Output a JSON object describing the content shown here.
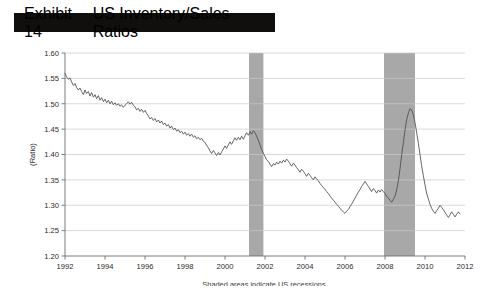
{
  "exhibit": {
    "number": "Exhibit 14",
    "title": "US Inventory/Sales Ratios"
  },
  "footnote": "Shaded areas indicate US recessions.",
  "colors": {
    "title_bar_bg": "#100f0d",
    "title_text": "#ffffff",
    "series_line": "#4c4c4c",
    "recession_band": "#a8a8a8",
    "grid": "#c9c9c9",
    "axis": "#6e6e6e",
    "page_bg": "#ffffff"
  },
  "chart_data": {
    "type": "line",
    "title": "US Inventory/Sales Ratios",
    "xlabel": "",
    "ylabel": "(Ratio)",
    "xlim": [
      1992,
      2012
    ],
    "ylim": [
      1.2,
      1.6
    ],
    "grid": true,
    "legend": "none",
    "xticks": [
      1992,
      1994,
      1996,
      1998,
      2000,
      2002,
      2004,
      2006,
      2008,
      2010,
      2012
    ],
    "xticklabels": [
      "1992",
      "1994",
      "1996",
      "1998",
      "2000",
      "2002",
      "2004",
      "2006",
      "2008",
      "2010",
      "2012"
    ],
    "yticks": [
      1.2,
      1.25,
      1.3,
      1.35,
      1.4,
      1.45,
      1.5,
      1.55,
      1.6
    ],
    "yticklabels": [
      "1.20",
      "1.25",
      "1.30",
      "1.35",
      "1.40",
      "1.45",
      "1.50",
      "1.55",
      "1.60"
    ],
    "annotations": [
      {
        "text": "Shaded areas indicate US recessions.",
        "position": "below-axis-center"
      }
    ],
    "shaded_regions": [
      {
        "label": "2001 recession",
        "x_start": 2001.2,
        "x_end": 2001.92,
        "color": "#a8a8a8"
      },
      {
        "label": "2007-2009 recession",
        "x_start": 2007.95,
        "x_end": 2009.5,
        "color": "#a8a8a8"
      }
    ],
    "series": [
      {
        "name": "US Inventory/Sales Ratio",
        "x": [
          1992.0,
          1992.08,
          1992.17,
          1992.25,
          1992.33,
          1992.42,
          1992.5,
          1992.58,
          1992.67,
          1992.75,
          1992.83,
          1992.92,
          1993.0,
          1993.08,
          1993.17,
          1993.25,
          1993.33,
          1993.42,
          1993.5,
          1993.58,
          1993.67,
          1993.75,
          1993.83,
          1993.92,
          1994.0,
          1994.08,
          1994.17,
          1994.25,
          1994.33,
          1994.42,
          1994.5,
          1994.58,
          1994.67,
          1994.75,
          1994.83,
          1994.92,
          1995.0,
          1995.08,
          1995.17,
          1995.25,
          1995.33,
          1995.42,
          1995.5,
          1995.58,
          1995.67,
          1995.75,
          1995.83,
          1995.92,
          1996.0,
          1996.08,
          1996.17,
          1996.25,
          1996.33,
          1996.42,
          1996.5,
          1996.58,
          1996.67,
          1996.75,
          1996.83,
          1996.92,
          1997.0,
          1997.08,
          1997.17,
          1997.25,
          1997.33,
          1997.42,
          1997.5,
          1997.58,
          1997.67,
          1997.75,
          1997.83,
          1997.92,
          1998.0,
          1998.08,
          1998.17,
          1998.25,
          1998.33,
          1998.42,
          1998.5,
          1998.58,
          1998.67,
          1998.75,
          1998.83,
          1998.92,
          1999.0,
          1999.08,
          1999.17,
          1999.25,
          1999.33,
          1999.42,
          1999.5,
          1999.58,
          1999.67,
          1999.75,
          1999.83,
          1999.92,
          2000.0,
          2000.08,
          2000.17,
          2000.25,
          2000.33,
          2000.42,
          2000.5,
          2000.58,
          2000.67,
          2000.75,
          2000.83,
          2000.92,
          2001.0,
          2001.08,
          2001.17,
          2001.25,
          2001.33,
          2001.42,
          2001.5,
          2001.58,
          2001.67,
          2001.75,
          2001.83,
          2001.92,
          2002.0,
          2002.08,
          2002.17,
          2002.25,
          2002.33,
          2002.42,
          2002.5,
          2002.58,
          2002.67,
          2002.75,
          2002.83,
          2002.92,
          2003.0,
          2003.08,
          2003.17,
          2003.25,
          2003.33,
          2003.42,
          2003.5,
          2003.58,
          2003.67,
          2003.75,
          2003.83,
          2003.92,
          2004.0,
          2004.08,
          2004.17,
          2004.25,
          2004.33,
          2004.42,
          2004.5,
          2004.58,
          2004.67,
          2004.75,
          2004.83,
          2004.92,
          2005.0,
          2005.08,
          2005.17,
          2005.25,
          2005.33,
          2005.42,
          2005.5,
          2005.58,
          2005.67,
          2005.75,
          2005.83,
          2005.92,
          2006.0,
          2006.08,
          2006.17,
          2006.25,
          2006.33,
          2006.42,
          2006.5,
          2006.58,
          2006.67,
          2006.75,
          2006.83,
          2006.92,
          2007.0,
          2007.08,
          2007.17,
          2007.25,
          2007.33,
          2007.42,
          2007.5,
          2007.58,
          2007.67,
          2007.75,
          2007.83,
          2007.92,
          2008.0,
          2008.08,
          2008.17,
          2008.25,
          2008.33,
          2008.42,
          2008.5,
          2008.58,
          2008.67,
          2008.75,
          2008.83,
          2008.92,
          2009.0,
          2009.08,
          2009.17,
          2009.25,
          2009.33,
          2009.42,
          2009.5,
          2009.58,
          2009.67,
          2009.75,
          2009.83,
          2009.92,
          2010.0,
          2010.08,
          2010.17,
          2010.25,
          2010.33,
          2010.42,
          2010.5,
          2010.58,
          2010.67,
          2010.75,
          2010.83,
          2010.92,
          2011.0,
          2011.08,
          2011.17,
          2011.25,
          2011.33,
          2011.42,
          2011.5,
          2011.58,
          2011.67,
          2011.75
        ],
        "y": [
          1.56,
          1.553,
          1.548,
          1.551,
          1.543,
          1.536,
          1.54,
          1.532,
          1.527,
          1.531,
          1.524,
          1.518,
          1.527,
          1.52,
          1.524,
          1.515,
          1.522,
          1.513,
          1.518,
          1.51,
          1.516,
          1.507,
          1.512,
          1.504,
          1.509,
          1.502,
          1.507,
          1.5,
          1.505,
          1.498,
          1.502,
          1.497,
          1.5,
          1.495,
          1.498,
          1.493,
          1.497,
          1.5,
          1.504,
          1.499,
          1.503,
          1.497,
          1.494,
          1.488,
          1.491,
          1.485,
          1.489,
          1.483,
          1.487,
          1.481,
          1.476,
          1.47,
          1.473,
          1.467,
          1.471,
          1.464,
          1.468,
          1.462,
          1.466,
          1.459,
          1.462,
          1.456,
          1.459,
          1.452,
          1.456,
          1.449,
          1.452,
          1.446,
          1.449,
          1.443,
          1.446,
          1.44,
          1.444,
          1.438,
          1.441,
          1.436,
          1.44,
          1.434,
          1.437,
          1.431,
          1.434,
          1.429,
          1.432,
          1.426,
          1.424,
          1.418,
          1.413,
          1.407,
          1.402,
          1.408,
          1.403,
          1.398,
          1.404,
          1.399,
          1.405,
          1.411,
          1.417,
          1.412,
          1.419,
          1.425,
          1.42,
          1.427,
          1.433,
          1.428,
          1.434,
          1.429,
          1.436,
          1.43,
          1.437,
          1.443,
          1.438,
          1.445,
          1.44,
          1.447,
          1.443,
          1.436,
          1.428,
          1.419,
          1.41,
          1.402,
          1.396,
          1.39,
          1.386,
          1.381,
          1.376,
          1.382,
          1.379,
          1.385,
          1.381,
          1.387,
          1.383,
          1.389,
          1.385,
          1.391,
          1.387,
          1.382,
          1.377,
          1.383,
          1.379,
          1.374,
          1.37,
          1.365,
          1.371,
          1.367,
          1.362,
          1.357,
          1.363,
          1.359,
          1.354,
          1.35,
          1.356,
          1.352,
          1.348,
          1.343,
          1.339,
          1.335,
          1.331,
          1.327,
          1.323,
          1.318,
          1.314,
          1.31,
          1.306,
          1.302,
          1.298,
          1.294,
          1.29,
          1.287,
          1.284,
          1.288,
          1.292,
          1.297,
          1.302,
          1.308,
          1.314,
          1.32,
          1.326,
          1.331,
          1.337,
          1.342,
          1.347,
          1.342,
          1.337,
          1.332,
          1.327,
          1.333,
          1.329,
          1.324,
          1.33,
          1.326,
          1.331,
          1.327,
          1.323,
          1.318,
          1.314,
          1.31,
          1.306,
          1.312,
          1.318,
          1.33,
          1.348,
          1.372,
          1.398,
          1.424,
          1.448,
          1.468,
          1.482,
          1.49,
          1.488,
          1.478,
          1.463,
          1.444,
          1.422,
          1.4,
          1.378,
          1.358,
          1.34,
          1.324,
          1.312,
          1.302,
          1.294,
          1.288,
          1.284,
          1.289,
          1.294,
          1.3,
          1.296,
          1.291,
          1.286,
          1.281,
          1.276,
          1.281,
          1.287,
          1.282,
          1.277,
          1.282,
          1.287,
          1.283
        ]
      }
    ]
  }
}
